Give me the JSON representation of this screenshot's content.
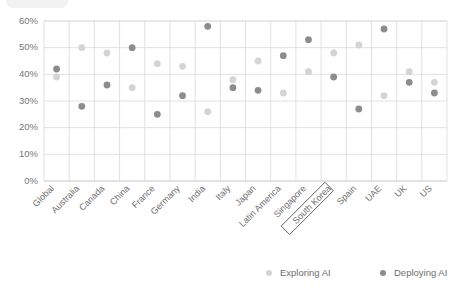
{
  "chart_data": {
    "type": "scatter",
    "title": "",
    "subtitle": "",
    "xlabel": "",
    "ylabel": "",
    "ylim": [
      0,
      0.6
    ],
    "ytick_labels": [
      "0%",
      "10%",
      "20%",
      "30%",
      "40%",
      "50%",
      "60%"
    ],
    "ytick_values": [
      0,
      10,
      20,
      30,
      40,
      50,
      60
    ],
    "grid": "both",
    "legend_position": "bottom-right",
    "categories": [
      "Global",
      "Australia",
      "Canada",
      "China",
      "France",
      "Germany",
      "India",
      "Italy",
      "Japan",
      "Latin America",
      "Singapore",
      "South Korea",
      "Spain",
      "UAE",
      "UK",
      "US"
    ],
    "highlighted_category": "South Korea",
    "series": [
      {
        "name": "Exploring AI",
        "color": "#d4d4d4",
        "values": [
          39,
          50,
          48,
          35,
          44,
          43,
          26,
          38,
          45,
          33,
          41,
          48,
          51,
          32,
          41,
          37
        ]
      },
      {
        "name": "Deploying AI",
        "color": "#8c8c8c",
        "values": [
          42,
          28,
          36,
          50,
          25,
          32,
          58,
          35,
          34,
          47,
          53,
          39,
          27,
          57,
          37,
          33
        ]
      }
    ]
  },
  "legend": {
    "items": [
      {
        "label": "Exploring AI",
        "color": "#d4d4d4"
      },
      {
        "label": "Deploying AI",
        "color": "#8c8c8c"
      }
    ]
  },
  "colors": {
    "exploring": "#d4d4d4",
    "deploying": "#8c8c8c",
    "grid": "#d9d9d9",
    "axis": "#bfbfbf",
    "text": "#6e6e6e",
    "highlight_outline": "#595959"
  }
}
